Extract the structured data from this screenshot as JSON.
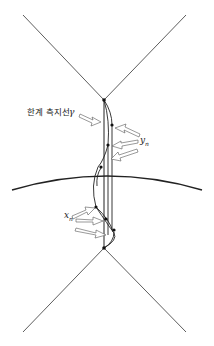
{
  "labels": {
    "geodesic": "한계 측지선",
    "gamma": "γ",
    "yn_base": "y",
    "yn_sub": "n",
    "xn_base": "x",
    "xn_sub": "n"
  },
  "colors": {
    "stroke": "#333333",
    "arrow_fill": "#ffffff",
    "arrow_stroke": "#555555",
    "point": "#111111"
  }
}
